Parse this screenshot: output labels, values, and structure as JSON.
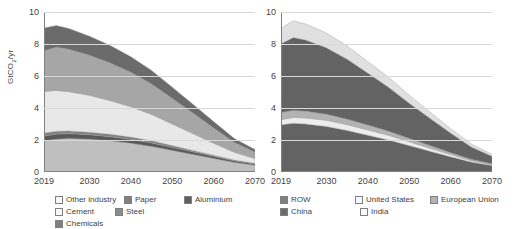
{
  "figure": {
    "background": "#ffffff"
  },
  "chart_data": [
    {
      "type": "area",
      "title": "",
      "panel": "left",
      "stacked": true,
      "xlabel": "",
      "ylabel": "GtCO2/yr",
      "ylabel_display": "GtCO₂/yr",
      "xlim": [
        2019,
        2070
      ],
      "ylim": [
        0,
        10
      ],
      "yticks": [
        0,
        2,
        4,
        6,
        8,
        10
      ],
      "xticks": [
        2019,
        2030,
        2040,
        2050,
        2060,
        2070
      ],
      "grid": true,
      "legend_position": "bottom",
      "x": [
        2019,
        2022,
        2025,
        2030,
        2035,
        2040,
        2045,
        2050,
        2055,
        2060,
        2065,
        2070
      ],
      "series": [
        {
          "name": "Chemicals",
          "color": "#bfbfbf",
          "values": [
            1.95,
            2.05,
            2.1,
            2.05,
            1.95,
            1.8,
            1.6,
            1.35,
            1.1,
            0.85,
            0.6,
            0.42
          ]
        },
        {
          "name": "Steel",
          "color": "#595959",
          "values": [
            0.3,
            0.32,
            0.3,
            0.28,
            0.26,
            0.24,
            0.22,
            0.19,
            0.16,
            0.13,
            0.1,
            0.08
          ]
        },
        {
          "name": "Paper",
          "color": "#808080",
          "values": [
            0.18,
            0.18,
            0.17,
            0.16,
            0.15,
            0.14,
            0.13,
            0.11,
            0.09,
            0.07,
            0.05,
            0.04
          ]
        },
        {
          "name": "Cement",
          "color": "#e8e8e8",
          "values": [
            2.6,
            2.55,
            2.45,
            2.3,
            2.1,
            1.9,
            1.65,
            1.35,
            1.05,
            0.75,
            0.48,
            0.3
          ]
        },
        {
          "name": "Aluminium",
          "color": "#a6a6a6",
          "values": [
            2.55,
            2.7,
            2.65,
            2.5,
            2.35,
            2.15,
            1.9,
            1.6,
            1.28,
            0.95,
            0.62,
            0.4
          ]
        },
        {
          "name": "Other industry",
          "color": "#6b6b6b",
          "values": [
            1.42,
            1.35,
            1.3,
            1.2,
            1.1,
            0.98,
            0.85,
            0.7,
            0.55,
            0.4,
            0.25,
            0.16
          ]
        }
      ],
      "legend": [
        {
          "label": "Other industry",
          "color": "#f7f7f7"
        },
        {
          "label": "Paper",
          "color": "#808080"
        },
        {
          "label": "Aluminium",
          "color": "#5e5e5e"
        },
        {
          "label": "Cement",
          "color": "#f7f7f7"
        },
        {
          "label": "Steel",
          "color": "#8c8c8c"
        },
        {
          "label": "Chemicals",
          "color": "#808080"
        }
      ]
    },
    {
      "type": "area",
      "title": "",
      "panel": "right",
      "stacked": true,
      "xlabel": "",
      "ylabel": "",
      "xlim": [
        2019,
        2070
      ],
      "ylim": [
        0,
        10
      ],
      "yticks": [
        0,
        2,
        4,
        6,
        8,
        10
      ],
      "xticks": [
        2019,
        2030,
        2040,
        2050,
        2060,
        2070
      ],
      "grid": true,
      "legend_position": "bottom",
      "x": [
        2019,
        2022,
        2025,
        2030,
        2035,
        2040,
        2045,
        2050,
        2055,
        2060,
        2065,
        2070
      ],
      "series": [
        {
          "name": "China",
          "color": "#636363",
          "values": [
            2.95,
            3.05,
            3.0,
            2.85,
            2.6,
            2.3,
            2.0,
            1.65,
            1.3,
            0.95,
            0.62,
            0.4
          ]
        },
        {
          "name": "India",
          "color": "#ededed",
          "values": [
            0.32,
            0.36,
            0.38,
            0.38,
            0.36,
            0.33,
            0.29,
            0.24,
            0.19,
            0.14,
            0.09,
            0.06
          ]
        },
        {
          "name": "European Union",
          "color": "#b3b3b3",
          "values": [
            0.45,
            0.44,
            0.42,
            0.38,
            0.34,
            0.3,
            0.26,
            0.21,
            0.17,
            0.12,
            0.08,
            0.05
          ]
        },
        {
          "name": "ROW",
          "color": "#636363",
          "values": [
            4.3,
            4.55,
            4.45,
            4.15,
            3.75,
            3.25,
            2.75,
            2.2,
            1.7,
            1.22,
            0.78,
            0.48
          ]
        },
        {
          "name": "United States",
          "color": "#e0e0e0",
          "values": [
            0.98,
            1.05,
            1.0,
            0.92,
            0.82,
            0.72,
            0.62,
            0.5,
            0.39,
            0.28,
            0.18,
            0.11
          ]
        }
      ],
      "legend": [
        {
          "label": "ROW",
          "color": "#808080"
        },
        {
          "label": "United States",
          "color": "#f7f7f7"
        },
        {
          "label": "European Union",
          "color": "#b3b3b3"
        },
        {
          "label": "China",
          "color": "#6b6b6b"
        },
        {
          "label": "India",
          "color": "#fafafa"
        }
      ]
    }
  ]
}
